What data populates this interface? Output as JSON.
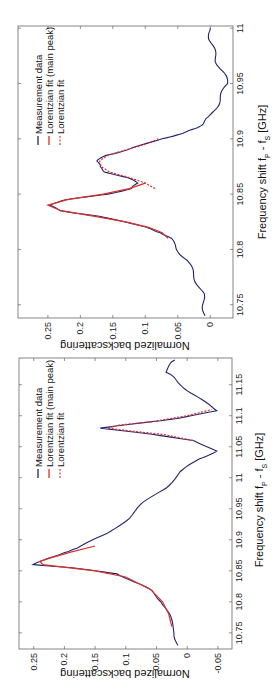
{
  "chart_data": [
    {
      "type": "line",
      "panel": "top",
      "orientation": "rotated-90-ccw",
      "xlabel": "Frequency shift f_P - f_S [GHz]",
      "ylabel": "Normalized backscattering",
      "xlim": [
        10.738,
        11.002
      ],
      "ylim": [
        -0.035,
        0.296
      ],
      "xticks": [
        "10.75",
        "10.8",
        "10.85",
        "10.9",
        "10.95",
        "11"
      ],
      "yticks": [
        "0",
        "0.05",
        "0.1",
        "0.15",
        "0.2",
        "0.25"
      ],
      "grid": false,
      "legend": [
        "Measurement data",
        "Lorentzian fit (main peak)",
        "Lorentzian fit"
      ],
      "legend_position": "upper-left",
      "series": [
        {
          "name": "Measurement data",
          "color": "#22236e",
          "style": "solid",
          "x": [
            10.74,
            10.75,
            10.76,
            10.77,
            10.78,
            10.79,
            10.8,
            10.81,
            10.815,
            10.82,
            10.83,
            10.835,
            10.84,
            10.845,
            10.85,
            10.855,
            10.86,
            10.865,
            10.87,
            10.875,
            10.88,
            10.885,
            10.89,
            10.895,
            10.9,
            10.905,
            10.91,
            10.915,
            10.92,
            10.93,
            10.94,
            10.95,
            10.96,
            10.97,
            10.98,
            10.99,
            11.0
          ],
          "y": [
            0.008,
            0.01,
            0.012,
            0.02,
            0.028,
            0.035,
            0.051,
            0.062,
            0.074,
            0.1,
            0.17,
            0.23,
            0.25,
            0.22,
            0.16,
            0.12,
            0.111,
            0.13,
            0.16,
            0.172,
            0.173,
            0.16,
            0.13,
            0.1,
            0.077,
            0.04,
            0.02,
            0.011,
            0.0,
            -0.01,
            -0.018,
            -0.026,
            -0.02,
            -0.01,
            -0.005,
            0.0,
            0.0
          ]
        },
        {
          "name": "Lorentzian fit (main peak)",
          "color": "#d9312a",
          "style": "solid",
          "x": [
            10.81,
            10.815,
            10.82,
            10.825,
            10.83,
            10.835,
            10.84,
            10.845,
            10.85,
            10.855,
            10.86
          ],
          "y": [
            0.065,
            0.074,
            0.095,
            0.13,
            0.18,
            0.23,
            0.25,
            0.22,
            0.165,
            0.125,
            0.1
          ]
        },
        {
          "name": "Lorentzian fit",
          "color": "#d9312a",
          "style": "dashed",
          "x": [
            10.855,
            10.86,
            10.865,
            10.87,
            10.875,
            10.88,
            10.885,
            10.89,
            10.895,
            10.9
          ],
          "y": [
            0.085,
            0.1,
            0.125,
            0.155,
            0.168,
            0.17,
            0.158,
            0.13,
            0.1,
            0.08
          ]
        }
      ]
    },
    {
      "type": "line",
      "panel": "bottom",
      "orientation": "rotated-90-ccw",
      "xlabel": "Frequency shift f_P - f_S [GHz]",
      "ylabel": "Normalized backscattering",
      "xlim": [
        10.724,
        11.193
      ],
      "ylim": [
        -0.073,
        0.274
      ],
      "xticks": [
        "10.75",
        "10.8",
        "10.85",
        "10.9",
        "10.95",
        "11",
        "11.05",
        "11.1",
        "11.15"
      ],
      "yticks": [
        "-0.05",
        "0",
        "0.05",
        "0.1",
        "0.15",
        "0.2",
        "0.25"
      ],
      "grid": false,
      "legend": [
        "Measurement data",
        "Lorentzian fit (main peak)",
        "Lorentzian fit"
      ],
      "legend_position": "upper-left",
      "series": [
        {
          "name": "Measurement data",
          "color": "#22236e",
          "style": "solid",
          "x": [
            10.73,
            10.75,
            10.78,
            10.8,
            10.818,
            10.83,
            10.845,
            10.855,
            10.86,
            10.87,
            10.887,
            10.91,
            10.935,
            10.96,
            10.984,
            11.01,
            11.03,
            11.043,
            11.06,
            11.07,
            11.08,
            11.09,
            11.096,
            11.108,
            11.12,
            11.14,
            11.16,
            11.17,
            11.19
          ],
          "y": [
            0.015,
            0.02,
            0.031,
            0.04,
            0.059,
            0.08,
            0.113,
            0.19,
            0.248,
            0.23,
            0.178,
            0.13,
            0.096,
            0.07,
            0.036,
            0.01,
            -0.02,
            -0.046,
            -0.013,
            0.06,
            0.14,
            0.06,
            0.015,
            -0.051,
            -0.03,
            -0.002,
            0.02,
            0.036,
            0.02
          ]
        },
        {
          "name": "Lorentzian fit (main peak)",
          "color": "#d9312a",
          "style": "solid",
          "x": [
            10.76,
            10.78,
            10.8,
            10.82,
            10.84,
            10.85,
            10.86,
            10.865,
            10.87,
            10.88,
            10.89
          ],
          "y": [
            0.025,
            0.03,
            0.04,
            0.06,
            0.1,
            0.15,
            0.235,
            0.24,
            0.225,
            0.19,
            0.15
          ]
        },
        {
          "name": "Lorentzian fit",
          "color": "#d9312a",
          "style": "dashed",
          "x": [
            11.06,
            11.07,
            11.075,
            11.08,
            11.085,
            11.09,
            11.1,
            11.11
          ],
          "y": [
            -0.01,
            0.04,
            0.09,
            0.13,
            0.11,
            0.06,
            0.0,
            -0.04
          ]
        }
      ]
    }
  ],
  "top": {
    "xlabel_text": "Frequency shift f",
    "xlabel_sub_p": "P",
    "xlabel_mid": " - f",
    "xlabel_sub_s": "S",
    "xlabel_tail": " [GHz]",
    "ylabel": "Normalized backscattering",
    "legend": [
      "Measurement data",
      "Lorentzian fit (main peak)",
      "Lorentzian fit"
    ]
  },
  "bottom": {
    "xlabel_text": "Frequency shift f",
    "xlabel_sub_p": "P",
    "xlabel_mid": " - f",
    "xlabel_sub_s": "S",
    "xlabel_tail": " [GHz]",
    "ylabel": "Normalized backscattering",
    "legend": [
      "Measurement data",
      "Lorentzian fit (main peak)",
      "Lorentzian fit"
    ]
  },
  "colors": {
    "data": "#22236e",
    "fit": "#d9312a",
    "axis": "#555555"
  }
}
